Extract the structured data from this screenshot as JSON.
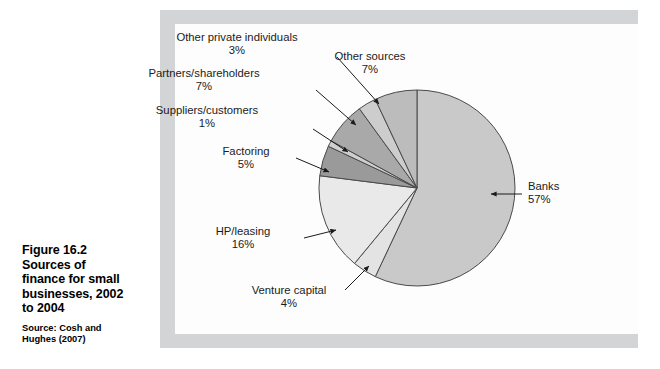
{
  "caption": {
    "figure_number": "Figure 16.2",
    "title_lines": [
      "Sources of",
      "finance for small",
      "businesses, 2002",
      "to 2004"
    ],
    "source_lines": [
      "Source: Cosh and",
      "Hughes (2007)"
    ]
  },
  "colors": {
    "frame": "#d2d4d6",
    "plate": "#fdfdfd",
    "outline": "#4a4a4a",
    "banks": "#c9c9c9",
    "venture_capital": "#e3e3e3",
    "hp_leasing": "#e9e9e9",
    "factoring": "#9a9a9a",
    "suppliers_customers": "#cfcfcf",
    "partners_shareholders": "#a9a9a9",
    "other_private_individuals": "#cdcdcd",
    "other_sources": "#bcbcbc",
    "label_text": "#1b1b1b"
  },
  "chart_data": {
    "type": "pie",
    "title": "Sources of finance for small businesses, 2002 to 2004",
    "source": "Source: Cosh and Hughes (2007)",
    "xlabel": "",
    "ylabel": "",
    "legend_position": "none",
    "grid": false,
    "labels_show_percent": true,
    "start_angle_deg": 0,
    "direction": "clockwise",
    "categories": [
      "Banks",
      "Venture capital",
      "HP/leasing",
      "Factoring",
      "Suppliers/customers",
      "Partners/shareholders",
      "Other private individuals",
      "Other sources"
    ],
    "values": [
      57,
      4,
      16,
      5,
      1,
      7,
      3,
      7
    ],
    "slices": [
      {
        "name": "Banks",
        "label": "Banks",
        "percent_label": "57%",
        "value": 57,
        "color": "#c9c9c9",
        "label_align": "left",
        "label_x": 528,
        "label_y": 187,
        "leader": {
          "x1": 522,
          "y1": 194,
          "x2": 491,
          "y2": 194,
          "arrow": "left"
        }
      },
      {
        "name": "Venture capital",
        "label": "Venture capital",
        "percent_label": "4%",
        "value": 4,
        "color": "#e3e3e3",
        "label_align": "center",
        "label_x": 289,
        "label_y": 291,
        "leader": {
          "x1": 345,
          "y1": 290,
          "x2": 369,
          "y2": 266,
          "arrow": "end"
        }
      },
      {
        "name": "HP/leasing",
        "label": "HP/leasing",
        "percent_label": "16%",
        "value": 16,
        "color": "#e9e9e9",
        "label_align": "center",
        "label_x": 243,
        "label_y": 232,
        "leader": {
          "x1": 304,
          "y1": 238,
          "x2": 336,
          "y2": 230,
          "arrow": "end"
        }
      },
      {
        "name": "Factoring",
        "label": "Factoring",
        "percent_label": "5%",
        "value": 5,
        "color": "#9a9a9a",
        "label_align": "center",
        "label_x": 246,
        "label_y": 152,
        "leader": {
          "x1": 296,
          "y1": 158,
          "x2": 329,
          "y2": 172,
          "arrow": "end"
        }
      },
      {
        "name": "Suppliers/customers",
        "label": "Suppliers/customers",
        "percent_label": "1%",
        "value": 1,
        "color": "#cfcfcf",
        "label_align": "center",
        "label_x": 207,
        "label_y": 111,
        "leader": {
          "x1": 313,
          "y1": 129,
          "x2": 348,
          "y2": 152,
          "arrow": "end"
        }
      },
      {
        "name": "Partners/shareholders",
        "label": "Partners/shareholders",
        "percent_label": "7%",
        "value": 7,
        "color": "#a9a9a9",
        "label_align": "center",
        "label_x": 204,
        "label_y": 74,
        "leader": {
          "x1": 316,
          "y1": 90,
          "x2": 356,
          "y2": 125,
          "arrow": "end"
        }
      },
      {
        "name": "Other private individuals",
        "label": "Other private individuals",
        "percent_label": "3%",
        "value": 3,
        "color": "#cdcdcd",
        "label_align": "center",
        "label_x": 237,
        "label_y": 38,
        "leader": {
          "x1": 337,
          "y1": 57,
          "x2": 379,
          "y2": 104,
          "arrow": "end"
        }
      },
      {
        "name": "Other sources",
        "label": "Other sources",
        "percent_label": "7%",
        "value": 7,
        "color": "#bcbcbc",
        "label_align": "center",
        "label_x": 370,
        "label_y": 57,
        "leader": null
      }
    ],
    "geometry": {
      "center_x": 417,
      "center_y": 188,
      "radius": 98
    }
  }
}
